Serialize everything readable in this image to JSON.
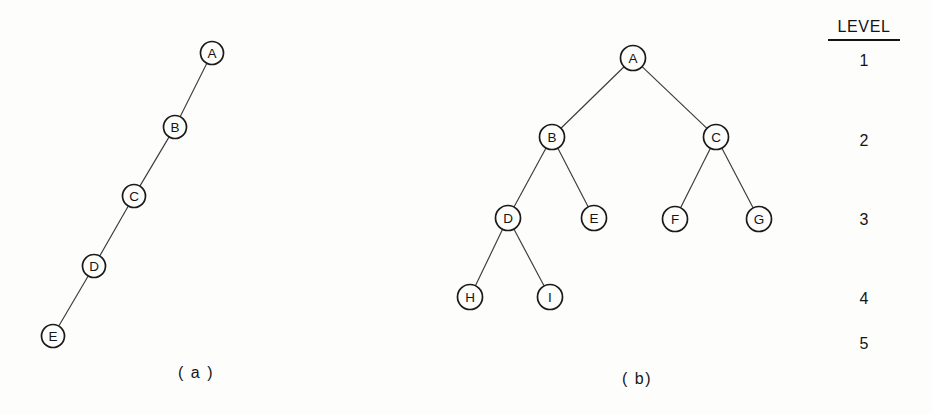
{
  "figure": {
    "background_color": "#fdfdfc",
    "ink_color": "#151515",
    "width": 932,
    "height": 414
  },
  "diagram_a": {
    "caption": "( a )",
    "caption_x": 196,
    "caption_y": 378,
    "node_radius": 11.5,
    "nodes": [
      {
        "id": "A",
        "label": "A",
        "x": 212,
        "y": 53
      },
      {
        "id": "B",
        "label": "B",
        "x": 175,
        "y": 127
      },
      {
        "id": "C",
        "label": "C",
        "x": 134,
        "y": 196
      },
      {
        "id": "D",
        "label": "D",
        "x": 94,
        "y": 266
      },
      {
        "id": "E",
        "label": "E",
        "x": 53,
        "y": 336
      }
    ],
    "edges": [
      {
        "from": "A",
        "to": "B"
      },
      {
        "from": "B",
        "to": "C"
      },
      {
        "from": "C",
        "to": "D"
      },
      {
        "from": "D",
        "to": "E"
      }
    ]
  },
  "diagram_b": {
    "caption": "( b)",
    "caption_x": 637,
    "caption_y": 384,
    "node_radius": 12.5,
    "nodes": [
      {
        "id": "A",
        "label": "A",
        "x": 633,
        "y": 58
      },
      {
        "id": "B",
        "label": "B",
        "x": 552,
        "y": 137
      },
      {
        "id": "C",
        "label": "C",
        "x": 716,
        "y": 137
      },
      {
        "id": "D",
        "label": "D",
        "x": 508,
        "y": 218
      },
      {
        "id": "E",
        "label": "E",
        "x": 594,
        "y": 218
      },
      {
        "id": "F",
        "label": "F",
        "x": 675,
        "y": 219
      },
      {
        "id": "G",
        "label": "G",
        "x": 759,
        "y": 219
      },
      {
        "id": "H",
        "label": "H",
        "x": 470,
        "y": 297
      },
      {
        "id": "I",
        "label": "I",
        "x": 550,
        "y": 297
      }
    ],
    "edges": [
      {
        "from": "A",
        "to": "B"
      },
      {
        "from": "A",
        "to": "C"
      },
      {
        "from": "B",
        "to": "D"
      },
      {
        "from": "B",
        "to": "E"
      },
      {
        "from": "C",
        "to": "F"
      },
      {
        "from": "C",
        "to": "G"
      },
      {
        "from": "D",
        "to": "H"
      },
      {
        "from": "D",
        "to": "I"
      }
    ]
  },
  "level_column": {
    "header": "LEVEL",
    "header_x": 864,
    "header_y": 32,
    "rule": {
      "x1": 828,
      "x2": 900,
      "y": 40
    },
    "levels": [
      {
        "label": "1",
        "x": 864,
        "y": 66
      },
      {
        "label": "2",
        "x": 864,
        "y": 146
      },
      {
        "label": "3",
        "x": 864,
        "y": 225
      },
      {
        "label": "4",
        "x": 864,
        "y": 304
      },
      {
        "label": "5",
        "x": 864,
        "y": 349
      }
    ]
  }
}
